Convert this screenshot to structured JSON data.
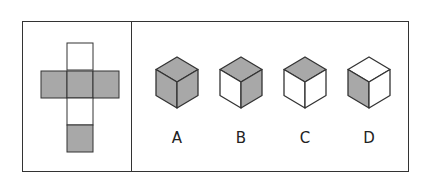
{
  "colors": {
    "gray": "#a8a8a8",
    "white": "#ffffff",
    "stroke": "#333333"
  },
  "net": {
    "squares": [
      {
        "x": 67,
        "y": 43,
        "fill": "white"
      },
      {
        "x": 41,
        "y": 71,
        "fill": "gray"
      },
      {
        "x": 67,
        "y": 71,
        "fill": "gray"
      },
      {
        "x": 93,
        "y": 71,
        "fill": "gray"
      },
      {
        "x": 67,
        "y": 98,
        "fill": "white"
      },
      {
        "x": 67,
        "y": 125,
        "fill": "gray"
      }
    ]
  },
  "options": [
    {
      "label": "A",
      "cx": 177,
      "top": "gray",
      "left": "gray",
      "right": "gray"
    },
    {
      "label": "B",
      "cx": 241,
      "top": "gray",
      "left": "white",
      "right": "gray"
    },
    {
      "label": "C",
      "cx": 305,
      "top": "gray",
      "left": "white",
      "right": "white"
    },
    {
      "label": "D",
      "cx": 369,
      "top": "white",
      "left": "gray",
      "right": "white"
    }
  ]
}
